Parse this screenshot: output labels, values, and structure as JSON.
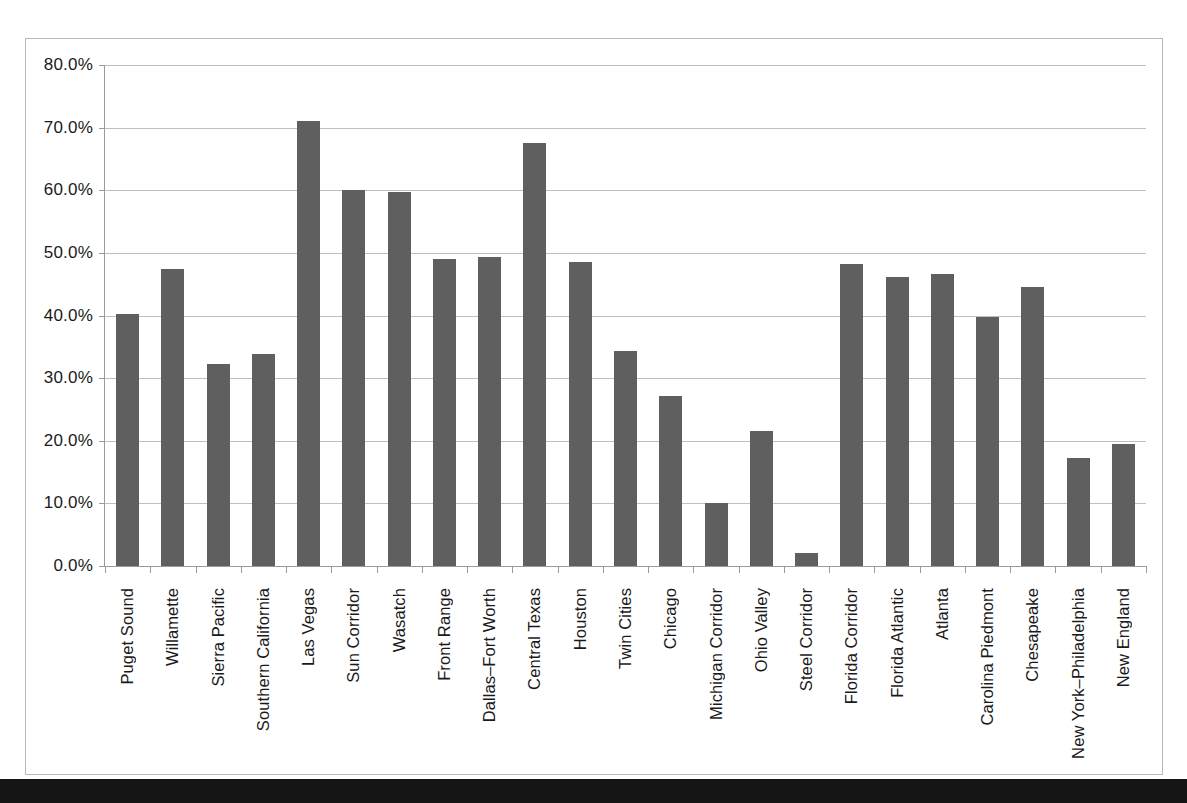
{
  "chart_data": {
    "type": "bar",
    "title": "",
    "subtitle": "",
    "xlabel": "",
    "ylabel": "",
    "ylim": [
      0,
      0.8
    ],
    "ytick_labels": [
      "80.0%",
      "70.0%",
      "60.0%",
      "50.0%",
      "40.0%",
      "30.0%",
      "20.0%",
      "10.0%",
      "0.0%"
    ],
    "ytick_values": [
      0.8,
      0.7,
      0.6,
      0.5,
      0.4,
      0.3,
      0.2,
      0.1,
      0.0
    ],
    "grid": true,
    "legend": "none",
    "bar_color": "#5F5F5F",
    "gridline_color": "#BFBFBF",
    "axis_color": "#9A9A9A",
    "frame_color": "#B8B8B8",
    "categories": [
      "Puget Sound",
      "Willamette",
      "Sierra Pacific",
      "Southern California",
      "Las Vegas",
      "Sun Corridor",
      "Wasatch",
      "Front Range",
      "Dallas–Fort Worth",
      "Central Texas",
      "Houston",
      "Twin Cities",
      "Chicago",
      "Michigan Corridor",
      "Ohio Valley",
      "Steel Corridor",
      "Florida Corridor",
      "Florida Atlantic",
      "Atlanta",
      "Carolina Piedmont",
      "Chesapeake",
      "New York–Philadelphia",
      "New England"
    ],
    "values": [
      0.403,
      0.474,
      0.322,
      0.338,
      0.71,
      0.6,
      0.598,
      0.491,
      0.493,
      0.675,
      0.486,
      0.344,
      0.272,
      0.101,
      0.215,
      0.021,
      0.482,
      0.462,
      0.466,
      0.398,
      0.446,
      0.173,
      0.195
    ],
    "value_labels": [
      "40.3%",
      "47.4%",
      "32.2%",
      "33.8%",
      "71.0%",
      "60.0%",
      "59.8%",
      "49.1%",
      "49.3%",
      "67.5%",
      "48.6%",
      "34.4%",
      "27.2%",
      "10.1%",
      "21.5%",
      "2.1%",
      "48.2%",
      "46.2%",
      "46.6%",
      "39.8%",
      "44.6%",
      "17.3%",
      "19.5%"
    ]
  }
}
